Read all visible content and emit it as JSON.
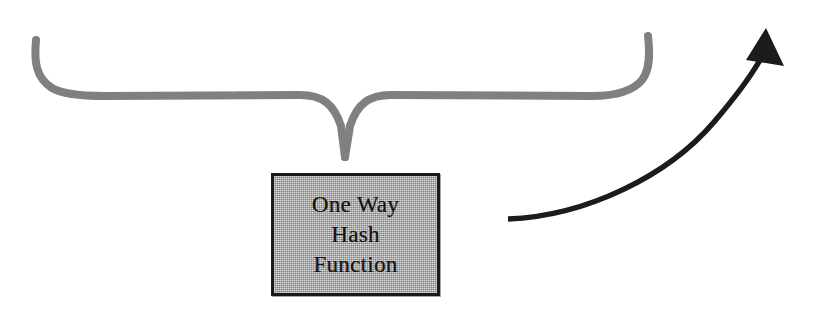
{
  "diagram": {
    "title": "One Way Hash Function",
    "canvas": {
      "width": 813,
      "height": 313,
      "background": "#ffffff"
    },
    "brace": {
      "name": "converging-curly-brace",
      "color": "#808080",
      "stroke_width": 8,
      "left_tip": {
        "x": 36,
        "y": 40
      },
      "right_tip": {
        "x": 648,
        "y": 36
      },
      "center_point": {
        "x": 345,
        "y": 158
      },
      "horizontal_y": 96
    },
    "box": {
      "name": "one-way-hash-function-box",
      "lines": [
        "One Way",
        "Hash",
        "Function"
      ],
      "fill": "#a9a9a9",
      "border_color": "#1a1a1a",
      "border_width": 3,
      "x": 271,
      "y": 173,
      "width": 169,
      "height": 123
    },
    "arrow": {
      "name": "output-arrow",
      "color": "#1a1a1a",
      "stroke_width": 5,
      "tail": {
        "x": 508,
        "y": 219
      },
      "head_tip": {
        "x": 766,
        "y": 28
      },
      "head_width": 32,
      "head_length": 34
    }
  }
}
